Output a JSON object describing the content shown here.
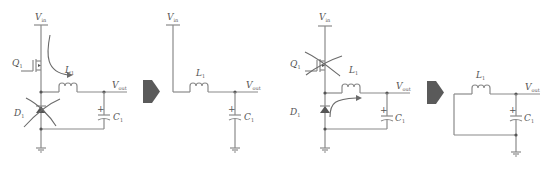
{
  "diagram": {
    "colors": {
      "wire": "#8a8a8a",
      "label": "#555555",
      "arrow": "#5a5a5a"
    },
    "panels": [
      {
        "id": "on-state-full",
        "labels": {
          "vin": "V",
          "vin_sub": "in",
          "vout": "V",
          "vout_sub": "out",
          "q": "Q",
          "q_sub": "1",
          "d": "D",
          "d_sub": "1",
          "l": "L",
          "l_sub": "1",
          "c": "C",
          "c_sub": "1",
          "plus": "+"
        },
        "crossed_component": "D1",
        "current_path": "Vin → Q1 → L1"
      },
      {
        "id": "on-state-equivalent",
        "labels": {
          "vin": "V",
          "vin_sub": "in",
          "vout": "V",
          "vout_sub": "out",
          "l": "L",
          "l_sub": "1",
          "c": "C",
          "c_sub": "1",
          "plus": "+"
        }
      },
      {
        "id": "off-state-full",
        "labels": {
          "vin": "V",
          "vin_sub": "in",
          "vout": "V",
          "vout_sub": "out",
          "q": "Q",
          "q_sub": "1",
          "d": "D",
          "d_sub": "1",
          "l": "L",
          "l_sub": "1",
          "c": "C",
          "c_sub": "1",
          "plus": "+"
        },
        "crossed_component": "Q1",
        "current_path": "D1 → L1"
      },
      {
        "id": "off-state-equivalent",
        "labels": {
          "vout": "V",
          "vout_sub": "out",
          "l": "L",
          "l_sub": "1",
          "c": "C",
          "c_sub": "1",
          "plus": "+"
        }
      }
    ],
    "transition_arrows": [
      "right-arrow",
      "right-arrow"
    ]
  }
}
